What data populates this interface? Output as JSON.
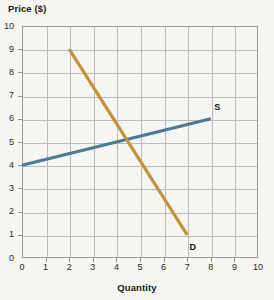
{
  "chart_data": {
    "type": "line",
    "title": "",
    "xlabel": "Quantity",
    "ylabel": "Price ($)",
    "xlim": [
      0,
      10
    ],
    "ylim": [
      0,
      10
    ],
    "xticks": [
      "0",
      "1",
      "2",
      "3",
      "4",
      "5",
      "6",
      "7",
      "8",
      "9",
      "10"
    ],
    "yticks": [
      "0",
      "1",
      "2",
      "3",
      "4",
      "5",
      "6",
      "7",
      "8",
      "9",
      "10"
    ],
    "grid": true,
    "legend_position": "inline-end-labels",
    "series": [
      {
        "name": "S",
        "label": "S",
        "description": "Supply curve",
        "color": "#4a7a96",
        "x": [
          0,
          8
        ],
        "y": [
          4,
          6
        ],
        "label_x": 8.15,
        "label_y": 6.45
      },
      {
        "name": "D",
        "label": "D",
        "description": "Demand curve",
        "color": "#c0933c",
        "x": [
          2,
          7
        ],
        "y": [
          9,
          1
        ],
        "label_x": 7.1,
        "label_y": 0.45
      }
    ],
    "annotations": [
      {
        "text": "equilibrium",
        "x": 4.5,
        "y": 5.0,
        "visible": false
      }
    ]
  },
  "axes": {
    "y_title": "Price ($)",
    "x_title": "Quantity"
  },
  "colors": {
    "supply": "#4a7a96",
    "demand": "#c0933c",
    "grid": "#b9bcc2",
    "border": "#9a9a9a",
    "background": "#f6f5f1",
    "text": "#1b1b1b"
  }
}
